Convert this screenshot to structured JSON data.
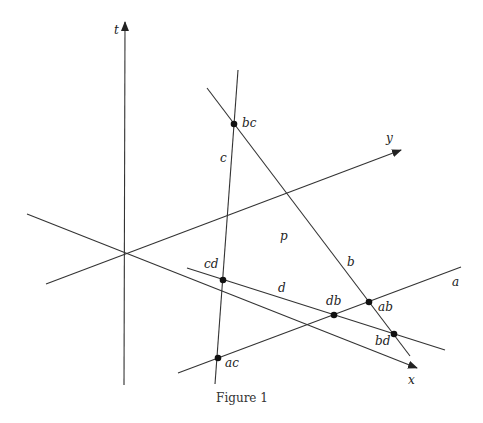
{
  "caption": "Figure 1",
  "axes": {
    "t": {
      "label": "t",
      "from": [
        124,
        385
      ],
      "to": [
        125,
        22
      ],
      "label_pos": [
        114,
        34
      ],
      "arrow": true
    },
    "y": {
      "label": "y",
      "from": [
        46,
        284
      ],
      "to": [
        401,
        150
      ],
      "label_pos": [
        386,
        142
      ],
      "arrow": true
    },
    "x": {
      "label": "x",
      "from": [
        27,
        214
      ],
      "to": [
        417,
        368
      ],
      "label_pos": [
        408,
        384
      ],
      "arrow": true
    }
  },
  "lines": {
    "a": {
      "label": "a",
      "from": [
        178,
        373
      ],
      "to": [
        461,
        267
      ],
      "label_pos": [
        452,
        286
      ]
    },
    "b": {
      "label": "b",
      "from": [
        207,
        88
      ],
      "to": [
        410,
        356
      ],
      "label_pos": [
        347,
        266
      ]
    },
    "c": {
      "label": "c",
      "from": [
        238,
        70
      ],
      "to": [
        215,
        384
      ],
      "label_pos": [
        220,
        162
      ]
    },
    "d": {
      "label": "d",
      "from": [
        187,
        268
      ],
      "to": [
        445,
        350
      ],
      "label_pos": [
        278,
        292
      ]
    }
  },
  "region_label": {
    "text": "p",
    "pos": [
      280,
      240
    ]
  },
  "points": [
    {
      "name": "bc",
      "pos": [
        234,
        124
      ],
      "label_pos": [
        242,
        127
      ]
    },
    {
      "name": "cd",
      "pos": [
        223,
        280
      ],
      "label_pos": [
        204,
        268
      ]
    },
    {
      "name": "db",
      "pos": [
        334,
        315
      ],
      "label_pos": [
        326,
        305
      ]
    },
    {
      "name": "ab",
      "pos": [
        369,
        302
      ],
      "label_pos": [
        378,
        311
      ]
    },
    {
      "name": "bd",
      "pos": [
        394,
        334
      ],
      "label_pos": [
        375,
        345
      ]
    },
    {
      "name": "ac",
      "pos": [
        218,
        358
      ],
      "label_pos": [
        225,
        367
      ]
    }
  ]
}
